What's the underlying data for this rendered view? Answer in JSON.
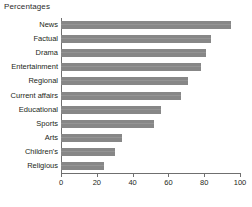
{
  "chart_data": {
    "type": "bar",
    "orientation": "horizontal",
    "title": "Percentages",
    "xlabel": "",
    "ylabel": "",
    "xlim": [
      0,
      100
    ],
    "xticks": [
      0,
      20,
      40,
      60,
      80,
      100
    ],
    "grid": false,
    "legend": false,
    "bar_color": "#878787",
    "axis_color": "#6f6f6f",
    "text_color": "#231f20",
    "categories": [
      "News",
      "Factual",
      "Drama",
      "Entertainment",
      "Regional",
      "Current affairs",
      "Educational",
      "Sports",
      "Arts",
      "Children's",
      "Religious"
    ],
    "values": [
      95,
      84,
      81,
      78,
      71,
      67,
      56,
      52,
      34,
      30,
      24
    ]
  }
}
